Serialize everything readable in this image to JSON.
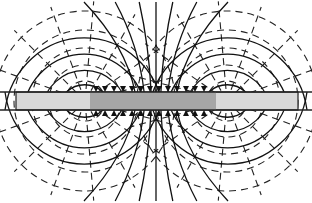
{
  "diagram": {
    "type": "field-lines",
    "width": 312,
    "height": 203,
    "colors": {
      "background": "#ffffff",
      "lines": "#111111",
      "bar_outer": "#d9d9d9",
      "bar_inner": "#a6a6a6",
      "bar_border": "#222222",
      "arrows": "#111111"
    },
    "bar": {
      "x": 16,
      "y": 92,
      "width": 282,
      "height": 18
    },
    "bar_inner": {
      "x": 90,
      "y": 92,
      "width": 126,
      "height": 18
    },
    "center": {
      "x": 156,
      "y": 101
    },
    "left_pole": {
      "x": 85,
      "y": 101
    },
    "right_pole": {
      "x": 227,
      "y": 101
    },
    "loop_radii": [
      14,
      28,
      44,
      62,
      80
    ],
    "equipotential_radii": [
      20,
      36,
      53,
      71,
      90
    ],
    "labels": []
  }
}
